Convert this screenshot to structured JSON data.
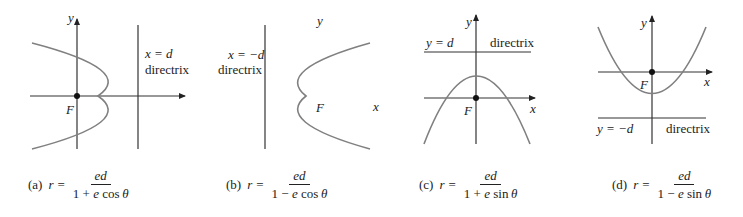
{
  "colors": {
    "curve": "#808080",
    "axis": "#333333",
    "text": "#222222"
  },
  "panels": [
    {
      "id": "a",
      "tag": "(a)",
      "lhs": "r",
      "eq": "=",
      "numerator": "ed",
      "den_const": "1",
      "den_op": "+",
      "den_e": "e",
      "den_fn": "cos",
      "den_var": "θ",
      "labels": {
        "y": "y",
        "x": "x",
        "focus": "F",
        "directrix_eq": "x = d",
        "directrix": "directrix"
      },
      "opens": "left"
    },
    {
      "id": "b",
      "tag": "(b)",
      "lhs": "r",
      "eq": "=",
      "numerator": "ed",
      "den_const": "1",
      "den_op": "−",
      "den_e": "e",
      "den_fn": "cos",
      "den_var": "θ",
      "labels": {
        "y": "y",
        "x": "x",
        "focus": "F",
        "directrix_eq": "x = −d",
        "directrix": "directrix"
      },
      "opens": "right"
    },
    {
      "id": "c",
      "tag": "(c)",
      "lhs": "r",
      "eq": "=",
      "numerator": "ed",
      "den_const": "1",
      "den_op": "+",
      "den_e": "e",
      "den_fn": "sin",
      "den_var": "θ",
      "labels": {
        "y": "y",
        "x": "x",
        "focus": "F",
        "directrix_eq": "y = d",
        "directrix": "directrix"
      },
      "opens": "down"
    },
    {
      "id": "d",
      "tag": "(d)",
      "lhs": "r",
      "eq": "=",
      "numerator": "ed",
      "den_const": "1",
      "den_op": "−",
      "den_e": "e",
      "den_fn": "sin",
      "den_var": "θ",
      "labels": {
        "y": "y",
        "x": "x",
        "focus": "F",
        "directrix_eq": "y = −d",
        "directrix": "directrix"
      },
      "opens": "up"
    }
  ]
}
